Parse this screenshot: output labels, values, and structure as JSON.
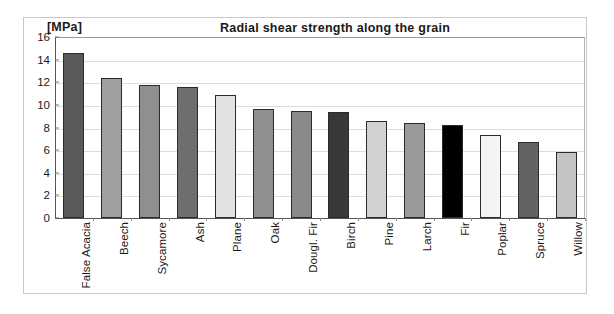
{
  "chart_data": {
    "type": "bar",
    "title": "Radial shear strength along the grain",
    "units_label": "[MPa]",
    "xlabel": "",
    "ylabel": "",
    "ylim": [
      0,
      16
    ],
    "ytick_step": 2,
    "grid": true,
    "legend": "none",
    "categories": [
      "False Acacia",
      "Beech",
      "Sycamore",
      "Ash",
      "Plane",
      "Oak",
      "Dougl. Fir",
      "Birch",
      "Pine",
      "Larch",
      "Fir",
      "Poplar",
      "Spruce",
      "Willow"
    ],
    "values": [
      14.6,
      12.4,
      11.8,
      11.6,
      10.9,
      9.6,
      9.5,
      9.4,
      8.6,
      8.4,
      8.2,
      7.3,
      6.7,
      5.8
    ],
    "ytick_labels": [
      "16",
      "14",
      "12",
      "10",
      "8",
      "6",
      "4",
      "2",
      "0"
    ],
    "ytick_values": [
      16,
      14,
      12,
      10,
      8,
      6,
      4,
      2,
      0
    ],
    "bar_colors": [
      "#5a5a5a",
      "#a0a0a0",
      "#8f8f8f",
      "#6e6e6e",
      "#e2e2e2",
      "#909090",
      "#8a8a8a",
      "#383838",
      "#d2d2d2",
      "#9a9a9a",
      "#000000",
      "#f4f4f4",
      "#636363",
      "#c4c4c4"
    ],
    "bar_edge_color": "#2b2b2b",
    "grid_color": "#dcdcdc",
    "axis_color": "#555555",
    "text_color": "#1a1a1a"
  }
}
